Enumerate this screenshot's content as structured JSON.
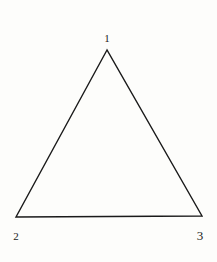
{
  "diagram": {
    "type": "triangle",
    "stroke_color": "#1a1a1a",
    "background": "#fdfdfb",
    "vertices": [
      {
        "id": "1",
        "label": "1",
        "x": 107,
        "y": 50,
        "label_x": 107,
        "label_y": 38
      },
      {
        "id": "2",
        "label": "2",
        "x": 16,
        "y": 217,
        "label_x": 16,
        "label_y": 236
      },
      {
        "id": "3",
        "label": "3",
        "x": 202,
        "y": 216,
        "label_x": 200,
        "label_y": 235
      }
    ]
  }
}
